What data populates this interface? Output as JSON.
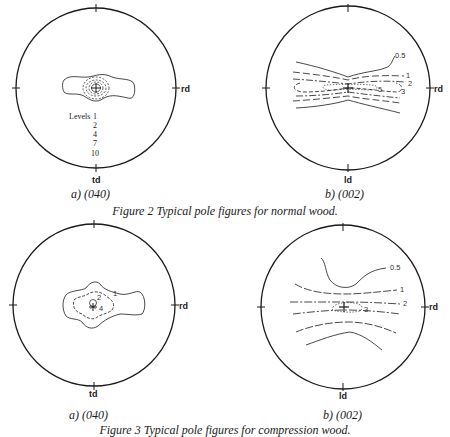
{
  "figure2": {
    "caption": "Figure 2  Typical pole figures for normal wood.",
    "panel_a": {
      "label": "a) (040)",
      "axis_right": "rd",
      "axis_bottom": "td",
      "levels_title": "Levels",
      "levels": [
        "1",
        "2",
        "4",
        "7",
        "10"
      ]
    },
    "panel_b": {
      "label": "b) (002)",
      "axis_right": "rd",
      "axis_bottom": "ld",
      "contour_labels": [
        "0.5",
        "1",
        "2",
        "3",
        "5"
      ]
    }
  },
  "figure3": {
    "caption": "Figure 3  Typical pole figures for compression wood.",
    "panel_a": {
      "label": "a) (040)",
      "axis_right": "rd",
      "axis_bottom": "td",
      "contour_labels": [
        "1",
        "2",
        "4"
      ]
    },
    "panel_b": {
      "label": "b) (002)",
      "axis_right": "rd",
      "axis_bottom": "ld",
      "contour_labels": [
        "0.5",
        "1",
        "2",
        "3"
      ]
    }
  }
}
